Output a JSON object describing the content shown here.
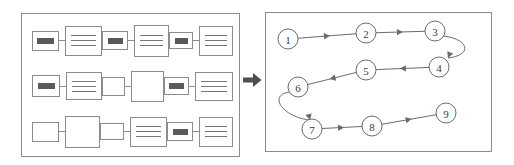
{
  "figure": {
    "arrow_icon": "right-arrow-icon"
  },
  "left_panel": {
    "name": "document-collection-panel",
    "rows": [
      {
        "pairs": [
          {
            "label_bar": true,
            "bar_width": "w-lg",
            "label_size": "sz-a",
            "content_size": "cz-a",
            "content_lines": 3
          },
          {
            "label_bar": true,
            "bar_width": "w-md",
            "label_size": "sz-b",
            "content_size": "cz-b",
            "content_lines": 3
          },
          {
            "label_bar": true,
            "bar_width": "w-sm",
            "label_size": "sz-c",
            "content_size": "cz-c",
            "content_lines": 3
          }
        ]
      },
      {
        "pairs": [
          {
            "label_bar": true,
            "bar_width": "w-lg",
            "label_size": "sz-d",
            "content_size": "cz-d",
            "content_lines": 3
          },
          {
            "label_bar": false,
            "bar_width": "w-md",
            "label_size": "sz-e",
            "content_size": "cz-e",
            "content_lines": 0
          },
          {
            "label_bar": true,
            "bar_width": "w-md",
            "label_size": "sz-f",
            "content_size": "cz-f",
            "content_lines": 3
          }
        ]
      },
      {
        "pairs": [
          {
            "label_bar": false,
            "bar_width": "w-lg",
            "label_size": "sz-a",
            "content_size": "cz-b",
            "content_lines": 0
          },
          {
            "label_bar": false,
            "bar_width": "w-sm",
            "label_size": "sz-c",
            "content_size": "cz-a",
            "content_lines": 3
          },
          {
            "label_bar": true,
            "bar_width": "w-md",
            "label_size": "sz-b",
            "content_size": "cz-c",
            "content_lines": 3
          }
        ]
      }
    ]
  },
  "right_panel": {
    "name": "process-flow-panel",
    "node_radius": 10,
    "nodes": [
      {
        "id": "1",
        "label": "1",
        "cx": 22,
        "cy": 26
      },
      {
        "id": "2",
        "label": "2",
        "cx": 100,
        "cy": 20
      },
      {
        "id": "3",
        "label": "3",
        "cx": 169,
        "cy": 18
      },
      {
        "id": "4",
        "label": "4",
        "cx": 173,
        "cy": 54
      },
      {
        "id": "5",
        "label": "5",
        "cx": 100,
        "cy": 57
      },
      {
        "id": "6",
        "label": "6",
        "cx": 32,
        "cy": 74
      },
      {
        "id": "7",
        "label": "7",
        "cx": 46,
        "cy": 116
      },
      {
        "id": "8",
        "label": "8",
        "cx": 106,
        "cy": 113
      },
      {
        "id": "9",
        "label": "9",
        "cx": 180,
        "cy": 100
      }
    ],
    "edges": [
      {
        "from": "1",
        "to": "2",
        "kind": "straight"
      },
      {
        "from": "2",
        "to": "3",
        "kind": "straight"
      },
      {
        "from": "3",
        "to": "4",
        "kind": "curve-right"
      },
      {
        "from": "4",
        "to": "5",
        "kind": "straight"
      },
      {
        "from": "5",
        "to": "6",
        "kind": "straight"
      },
      {
        "from": "6",
        "to": "7",
        "kind": "curve-left"
      },
      {
        "from": "7",
        "to": "8",
        "kind": "straight"
      },
      {
        "from": "8",
        "to": "9",
        "kind": "straight"
      }
    ]
  },
  "colors": {
    "panel_border": "#8c8c8c",
    "node_stroke": "#6b6b6b",
    "label_bar": "#5a5a5a",
    "text_line": "#777777",
    "background": "#ffffff"
  }
}
